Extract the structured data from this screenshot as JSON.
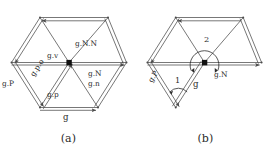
{
  "figure": {
    "kind": "math-diagram",
    "stroke_color": "#4a4a4a",
    "node_color": "#111111",
    "background": "#ffffff"
  },
  "panels": [
    {
      "id": "a",
      "caption": "(a)",
      "labels": {
        "gv": "g.v",
        "gNN": "g.N.N",
        "gN": "g.N",
        "gn": "g.n",
        "gP_upper": "g.P",
        "gpo": "g.p.o",
        "gp": "g.p",
        "g": "g"
      }
    },
    {
      "id": "b",
      "caption": "(b)",
      "labels": {
        "angle2": "2",
        "angle1": "1",
        "gN": "g.N",
        "gP": "g.P",
        "g": "g"
      }
    }
  ]
}
